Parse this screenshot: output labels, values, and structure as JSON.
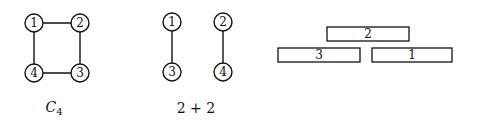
{
  "figures": [
    {
      "id": "c4",
      "caption": {
        "main": "C",
        "subscript": "4"
      },
      "nodes": [
        {
          "label": "1"
        },
        {
          "label": "2"
        },
        {
          "label": "3"
        },
        {
          "label": "4"
        }
      ],
      "edges": [
        [
          "1",
          "2"
        ],
        [
          "2",
          "3"
        ],
        [
          "3",
          "4"
        ],
        [
          "4",
          "1"
        ]
      ]
    },
    {
      "id": "two-plus-two",
      "caption": {
        "main": "2 + 2"
      },
      "nodes": [
        {
          "label": "1"
        },
        {
          "label": "2"
        },
        {
          "label": "3"
        },
        {
          "label": "4"
        }
      ],
      "edges": [
        [
          "1",
          "3"
        ],
        [
          "2",
          "4"
        ]
      ]
    },
    {
      "id": "interval-representation",
      "intervals": [
        {
          "label": "2",
          "row": "top"
        },
        {
          "label": "3",
          "row": "bottom-left"
        },
        {
          "label": "1",
          "row": "bottom-right"
        }
      ]
    }
  ]
}
